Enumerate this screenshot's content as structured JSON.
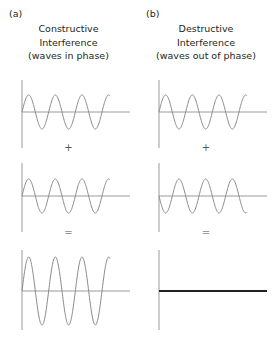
{
  "figure": {
    "background": "#ffffff",
    "wave_color": "#8a8a8a",
    "axis_color": "#9a9a9a",
    "result_line_color": "#231f20",
    "panels": [
      {
        "label": "(a)",
        "title_lines": [
          "Constructive",
          "Interference",
          "(waves in phase)"
        ],
        "operators": [
          {
            "symbol": "+",
            "kind": "plus"
          },
          {
            "symbol": "=",
            "kind": "equals"
          }
        ]
      },
      {
        "label": "(b)",
        "title_lines": [
          "Destructive",
          "Interference",
          "(waves out of phase)"
        ],
        "operators": [
          {
            "symbol": "+",
            "kind": "plus"
          },
          {
            "symbol": "=",
            "kind": "equals"
          }
        ]
      }
    ]
  },
  "chart_data": {
    "type": "line",
    "xlabel": "",
    "ylabel": "",
    "grid": false,
    "legend": "none",
    "wave_defs": {
      "cycles": 3.3,
      "x_start": 22,
      "x_end": 110,
      "baseline_extends_to": 130,
      "unit_amplitude": 17,
      "double_amplitude": 34,
      "samples": 240
    },
    "panels": [
      {
        "id": "a",
        "name": "Constructive Interference",
        "phase_relationship": "in phase",
        "phase_difference_deg": 0,
        "rows": [
          {
            "name": "wave-1",
            "amplitude": 17,
            "phase_deg": 0,
            "cycles": 3.3,
            "baseline_y": 112,
            "flat": false
          },
          {
            "name": "wave-2",
            "amplitude": 17,
            "phase_deg": 0,
            "cycles": 3.3,
            "baseline_y": 196,
            "flat": false
          },
          {
            "name": "resultant-wave",
            "amplitude": 34,
            "phase_deg": 0,
            "cycles": 3.3,
            "baseline_y": 291,
            "flat": false
          }
        ]
      },
      {
        "id": "b",
        "name": "Destructive Interference",
        "phase_relationship": "out of phase",
        "phase_difference_deg": 180,
        "rows": [
          {
            "name": "wave-1",
            "amplitude": 17,
            "phase_deg": 0,
            "cycles": 3.3,
            "baseline_y": 112,
            "flat": false
          },
          {
            "name": "wave-2",
            "amplitude": 17,
            "phase_deg": 180,
            "cycles": 3.3,
            "baseline_y": 196,
            "flat": false
          },
          {
            "name": "resultant-wave",
            "amplitude": 0,
            "phase_deg": 0,
            "cycles": 3.3,
            "baseline_y": 291,
            "flat": true
          }
        ]
      }
    ],
    "axes": [
      {
        "name": "vertical-axis-row-1",
        "x": 22,
        "y_top": 80,
        "y_bottom": 148
      },
      {
        "name": "vertical-axis-row-2",
        "x": 22,
        "y_top": 163,
        "y_bottom": 232
      },
      {
        "name": "vertical-axis-row-3",
        "x": 22,
        "y_top": 250,
        "y_bottom": 330
      }
    ],
    "operator_positions": [
      {
        "symbol": "+",
        "y": 143
      },
      {
        "symbol": "=",
        "y": 228
      }
    ]
  }
}
